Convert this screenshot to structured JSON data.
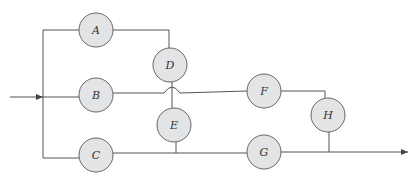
{
  "diagram": {
    "type": "reliability-block-network",
    "nodes": [
      {
        "id": "A",
        "label": "A",
        "cx": 96,
        "cy": 30
      },
      {
        "id": "B",
        "label": "B",
        "cx": 96,
        "cy": 97
      },
      {
        "id": "C",
        "label": "C",
        "cx": 96,
        "cy": 158
      },
      {
        "id": "D",
        "label": "D",
        "cx": 169,
        "cy": 65
      },
      {
        "id": "E",
        "label": "E",
        "cx": 174,
        "cy": 125
      },
      {
        "id": "F",
        "label": "F",
        "cx": 264,
        "cy": 91
      },
      {
        "id": "G",
        "label": "G",
        "cx": 264,
        "cy": 153
      },
      {
        "id": "H",
        "label": "H",
        "cx": 328,
        "cy": 115
      }
    ],
    "edges": [
      {
        "from": "input",
        "to": "split"
      },
      {
        "from": "split",
        "to": "A"
      },
      {
        "from": "split",
        "to": "B"
      },
      {
        "from": "split",
        "to": "C"
      },
      {
        "from": "A",
        "to": "D"
      },
      {
        "from": "D",
        "to": "E"
      },
      {
        "from": "B",
        "to": "F",
        "note": "crosses D-E link with a hop"
      },
      {
        "from": "C",
        "to": "G"
      },
      {
        "from": "E",
        "to": "C-G line"
      },
      {
        "from": "F",
        "to": "H"
      },
      {
        "from": "H",
        "to": "output"
      },
      {
        "from": "G",
        "to": "output"
      }
    ],
    "node_radius": 17
  }
}
